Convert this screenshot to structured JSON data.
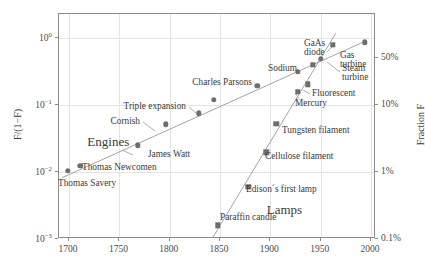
{
  "chart_data": {
    "type": "scatter",
    "title": "",
    "xlabel": "",
    "ylabel": "F/(1−F)",
    "ylabel_right": "Fraction F",
    "xlim": [
      1690,
      2005
    ],
    "ylim_log10": [
      -3.0,
      0.35
    ],
    "grid": true,
    "legend": false,
    "xticks": [
      1700,
      1750,
      1800,
      1850,
      1900,
      1950,
      2000
    ],
    "xtick_labels": [
      "1700",
      "1750",
      "1800",
      "1850",
      "1900",
      "1950",
      "2000"
    ],
    "yticks_log10": [
      0,
      -1,
      -2,
      -3
    ],
    "ytick_labels": [
      "10⁰",
      "10⁻¹",
      "10⁻²",
      "10⁻³"
    ],
    "ytick_right_values": [
      0.5,
      0.1,
      0.01,
      0.001
    ],
    "ytick_right_labels": [
      "50%",
      "10%",
      "1%",
      "0.1%"
    ],
    "group_labels": [
      {
        "text": "Engines",
        "x": 1740,
        "y": 0.027
      },
      {
        "text": "Lamps",
        "x": 1915,
        "y": 0.0026
      }
    ],
    "series": [
      {
        "name": "Engines",
        "marker": "circle",
        "color": "#6e6e6e",
        "trendline": {
          "x1": 1694,
          "y1": 0.0079,
          "x2": 1996,
          "y2": 0.86
        },
        "points": [
          {
            "label": "Thomas Savery",
            "x": 1700,
            "y": 0.01,
            "label_pos": "below-left"
          },
          {
            "label": "Thomas Newcomen",
            "x": 1712,
            "y": 0.0118,
            "label_pos": "right"
          },
          {
            "label": "James Watt",
            "x": 1769,
            "y": 0.024,
            "label_pos": "right-leader"
          },
          {
            "label": "Cornish",
            "x": 1797,
            "y": 0.049,
            "label_pos": "left-leader"
          },
          {
            "label": "Triple expansion",
            "x": 1830,
            "y": 0.072,
            "label_pos": "left-leader"
          },
          {
            "label": "",
            "x": 1845,
            "y": 0.113,
            "label_pos": "none"
          },
          {
            "label": "Charles Parsons",
            "x": 1888,
            "y": 0.185,
            "label_pos": "left"
          },
          {
            "label": "",
            "x": 1928,
            "y": 0.3,
            "label_pos": "none"
          },
          {
            "label": "Steam turbine",
            "x": 1951,
            "y": 0.47,
            "label_pos": "right-leader"
          },
          {
            "label": "Gas turbine",
            "x": 1995,
            "y": 0.82,
            "label_pos": "left"
          }
        ]
      },
      {
        "name": "Lamps",
        "marker": "square",
        "color": "#6e6e6e",
        "trendline": {
          "x1": 1843,
          "y1": 0.00097,
          "x2": 1966,
          "y2": 1.12
        },
        "points": [
          {
            "label": "Paraffin candle",
            "x": 1849,
            "y": 0.00155,
            "label_pos": "right"
          },
          {
            "label": "Edison´s first lamp",
            "x": 1879,
            "y": 0.0058,
            "label_pos": "right"
          },
          {
            "label": "Cellulose filament",
            "x": 1897,
            "y": 0.019,
            "label_pos": "right"
          },
          {
            "label": "Tungsten filament",
            "x": 1907,
            "y": 0.05,
            "label_pos": "right"
          },
          {
            "label": "Mercury",
            "x": 1928,
            "y": 0.15,
            "label_pos": "below"
          },
          {
            "label": "Fluorescent",
            "x": 1938,
            "y": 0.195,
            "label_pos": "right"
          },
          {
            "label": "Sodium",
            "x": 1943,
            "y": 0.38,
            "label_pos": "left"
          },
          {
            "label": "GaAs diode",
            "x": 1963,
            "y": 0.76,
            "label_pos": "above-left"
          }
        ]
      }
    ]
  },
  "annotations": {
    "thomas_savery": "Thomas Savery",
    "thomas_newcomen": "Thomas Newcomen",
    "james_watt": "James Watt",
    "cornish": "Cornish",
    "triple_expansion": "Triple expansion",
    "charles_parsons": "Charles Parsons",
    "steam_turbine_l1": "Steam",
    "steam_turbine_l2": "turbine",
    "gas_turbine_l1": "Gas",
    "gas_turbine_l2": "turbine",
    "paraffin_candle": "Paraffin candle",
    "edisons_first_lamp": "Edison´s first lamp",
    "cellulose_filament": "Cellulose filament",
    "tungsten_filament": "Tungsten filament",
    "mercury": "Mercury",
    "fluorescent": "Fluorescent",
    "sodium": "Sodium",
    "gaas_l1": "GaAs",
    "gaas_l2": "diode",
    "engines": "Engines",
    "lamps": "Lamps"
  },
  "axes": {
    "y_left_title": "F/(1−F)",
    "y_right_title": "Fraction F",
    "x_labels": [
      "1700",
      "1750",
      "1800",
      "1850",
      "1900",
      "1950",
      "2000"
    ],
    "y_left_labels": [
      "10",
      "10",
      "10",
      "10"
    ],
    "y_left_exponents": [
      "0",
      "−1",
      "−2",
      "−3"
    ],
    "y_right_labels": [
      "50%",
      "10%",
      "1%",
      "0.1%"
    ]
  },
  "colors": {
    "marker": "#6e6e6e",
    "trendline": "#9a9a9a",
    "grid": "#e4e4e4",
    "frame": "#8a8a8a",
    "text": "#3a3a3a",
    "background": "#ffffff"
  }
}
